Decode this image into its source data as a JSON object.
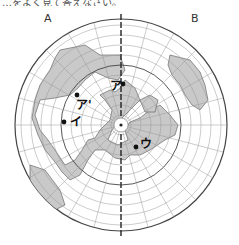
{
  "title_fragment": "…をよく見て答えなさい。",
  "projection": "north-polar azimuthal equidistant",
  "corner_labels": {
    "a": "A",
    "b": "B"
  },
  "points": [
    {
      "id": "a",
      "label": "ア",
      "x": 123,
      "y": 84
    },
    {
      "id": "a_prime",
      "label": "ア'",
      "x": 77,
      "y": 95
    },
    {
      "id": "i",
      "label": "イ",
      "x": 64,
      "y": 122
    },
    {
      "id": "u",
      "label": "ウ",
      "x": 136,
      "y": 147
    }
  ],
  "colors": {
    "land": "#c9c9c9",
    "grid": "#999999",
    "outline": "#444444",
    "meridian_ab": "#222222",
    "point": "#111111"
  }
}
